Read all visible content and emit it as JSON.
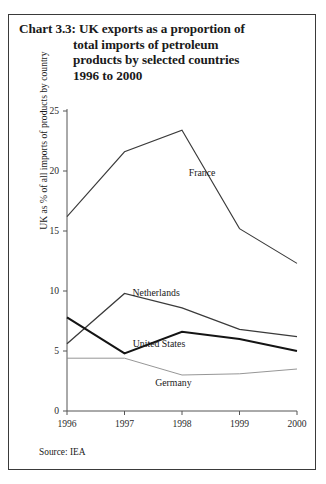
{
  "figure": {
    "title_label": "Chart 3.3:",
    "title_lines": [
      "UK exports as a proportion of",
      "total imports of petroleum",
      "products by selected countries",
      "1996 to 2000"
    ],
    "source": "Source: IEA"
  },
  "chart_data": {
    "type": "line",
    "title": "Chart 3.3: UK exports as a proportion of total imports of petroleum products by selected countries 1996 to 2000",
    "xlabel": "",
    "ylabel": "UK as % of all imports of products by country",
    "categories": [
      "1996",
      "1997",
      "1998",
      "1999",
      "2000"
    ],
    "x_tick_labels": [
      "1996",
      "1997",
      "1998",
      "1999",
      "2000"
    ],
    "y_tick_labels": [
      "0",
      "5",
      "10",
      "15",
      "20",
      "25"
    ],
    "y_ticks": [
      0,
      5,
      10,
      15,
      20,
      25
    ],
    "ylim": [
      0,
      25
    ],
    "grid": false,
    "legend_position": "inline-annotations",
    "series": [
      {
        "name": "France",
        "values": [
          16.2,
          21.6,
          23.4,
          15.2,
          12.3
        ],
        "color": "#3a3a3a",
        "width": 1.1,
        "label_x": 1998.35,
        "label_y": 19.6
      },
      {
        "name": "Netherlands",
        "values": [
          5.6,
          9.8,
          8.6,
          6.8,
          6.2
        ],
        "color": "#3a3a3a",
        "width": 1.3,
        "label_x": 1997.55,
        "label_y": 9.6
      },
      {
        "name": "United States",
        "values": [
          7.8,
          4.8,
          6.6,
          6.0,
          5.0
        ],
        "color": "#141414",
        "width": 2.1,
        "label_x": 1997.6,
        "label_y": 5.3
      },
      {
        "name": "Germany",
        "values": [
          4.4,
          4.4,
          3.0,
          3.1,
          3.5
        ],
        "color": "#8a8a8a",
        "width": 0.9,
        "label_x": 1997.85,
        "label_y": 2.05
      }
    ]
  }
}
